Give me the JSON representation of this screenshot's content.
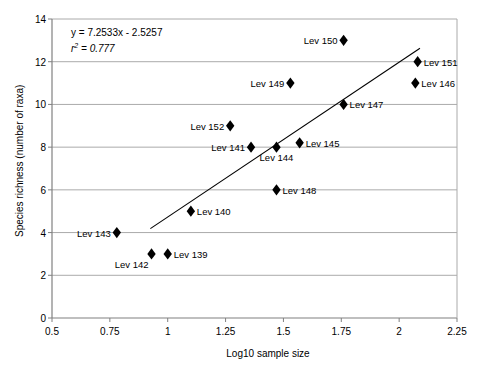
{
  "chart_data": {
    "type": "scatter",
    "title": "",
    "xlabel": "Log10 sample size",
    "ylabel": "Species richness (number of raxa)",
    "xlim": [
      0.5,
      2.25
    ],
    "ylim": [
      0,
      14
    ],
    "xticks": [
      "0.5",
      "0.75",
      "1",
      "1.25",
      "1.5",
      "1.75",
      "2",
      "2.25"
    ],
    "xtick_values": [
      0.5,
      0.75,
      1,
      1.25,
      1.5,
      1.75,
      2,
      2.25
    ],
    "yticks": [
      "0",
      "2",
      "4",
      "6",
      "8",
      "10",
      "12",
      "14"
    ],
    "ytick_values": [
      0,
      2,
      4,
      6,
      8,
      10,
      12,
      14
    ],
    "grid": "horizontal",
    "legend": "none",
    "marker": "diamond",
    "marker_color": "#000000",
    "line_color": "#000000",
    "annotations": {
      "equation": "y = 7.2533x - 2.5257",
      "r_squared_prefix": "r",
      "r_squared_exponent": "2",
      "r_squared_value": "= 0.777"
    },
    "trendline": {
      "slope": 7.2533,
      "intercept": -2.5257,
      "x_start": 0.925,
      "x_end": 2.09
    },
    "points": [
      {
        "label": "Lev 139",
        "x": 1.0,
        "y": 3,
        "label_pos": "right"
      },
      {
        "label": "Lev 140",
        "x": 1.1,
        "y": 5,
        "label_pos": "right"
      },
      {
        "label": "Lev 141",
        "x": 1.36,
        "y": 8,
        "label_pos": "left"
      },
      {
        "label": "Lev 142",
        "x": 0.93,
        "y": 3,
        "label_pos": "below-left"
      },
      {
        "label": "Lev 143",
        "x": 0.78,
        "y": 4,
        "label_pos": "left"
      },
      {
        "label": "Lev 144",
        "x": 1.47,
        "y": 8,
        "label_pos": "below"
      },
      {
        "label": "Lev 145",
        "x": 1.57,
        "y": 8.2,
        "label_pos": "right"
      },
      {
        "label": "Lev 146",
        "x": 2.07,
        "y": 11,
        "label_pos": "right"
      },
      {
        "label": "Lev 147",
        "x": 1.76,
        "y": 10,
        "label_pos": "right"
      },
      {
        "label": "Lev 148",
        "x": 1.47,
        "y": 6,
        "label_pos": "right"
      },
      {
        "label": "Lev 149",
        "x": 1.53,
        "y": 11,
        "label_pos": "left"
      },
      {
        "label": "Lev 150",
        "x": 1.76,
        "y": 13,
        "label_pos": "left"
      },
      {
        "label": "Lev 151",
        "x": 2.08,
        "y": 12,
        "label_pos": "right"
      },
      {
        "label": "Lev 152",
        "x": 1.27,
        "y": 9,
        "label_pos": "left"
      }
    ]
  }
}
